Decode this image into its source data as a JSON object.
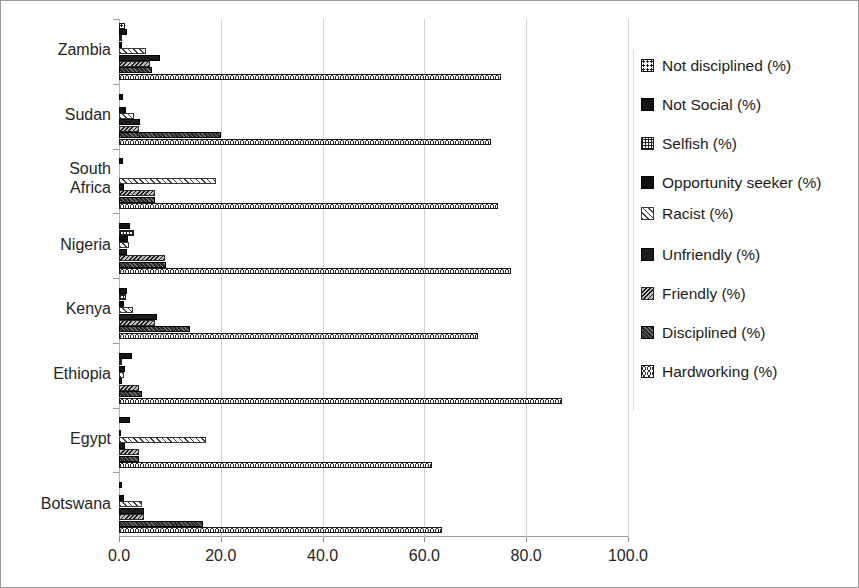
{
  "chart_data": {
    "type": "bar",
    "orientation": "horizontal",
    "title": "",
    "xlabel": "",
    "ylabel": "",
    "xlim": [
      0,
      100
    ],
    "xticks": [
      "0.0",
      "20.0",
      "40.0",
      "60.0",
      "80.0",
      "100.0"
    ],
    "xtick_values": [
      0,
      20,
      40,
      60,
      80,
      100
    ],
    "grid": true,
    "legend_position": "right",
    "categories": [
      "Zambia",
      "Sudan",
      "South Africa",
      "Nigeria",
      "Kenya",
      "Ethiopia",
      "Egypt",
      "Botswana"
    ],
    "series": [
      {
        "name": "Not disciplined  (%)",
        "pattern": "dotted-grid",
        "values": [
          1.2,
          0.0,
          0.0,
          0.0,
          0.0,
          0.0,
          0.0,
          0.0
        ]
      },
      {
        "name": "Not Social (%)",
        "pattern": "solid-black",
        "values": [
          1.5,
          0.8,
          0.7,
          2.2,
          1.6,
          2.6,
          2.2,
          0.6
        ]
      },
      {
        "name": "Selfish (%)",
        "pattern": "cross-hatch",
        "values": [
          0.6,
          0.0,
          0.0,
          2.9,
          1.3,
          0.5,
          0.0,
          0.0
        ]
      },
      {
        "name": "Opportunity seeker (%)",
        "pattern": "solid-black",
        "values": [
          0.5,
          1.3,
          0.0,
          1.8,
          1.0,
          1.1,
          0.4,
          1.0
        ]
      },
      {
        "name": "Racist (%)",
        "pattern": "diagonal-light",
        "values": [
          5.3,
          3.0,
          19.0,
          2.0,
          2.7,
          1.0,
          17.0,
          4.5
        ]
      },
      {
        "name": "Unfriendly (%)",
        "pattern": "dark-speckle",
        "values": [
          8.0,
          4.2,
          0.9,
          1.6,
          7.4,
          0.6,
          1.2,
          5.0
        ]
      },
      {
        "name": "Friendly (%)",
        "pattern": "diagonal-dark",
        "values": [
          6.0,
          4.0,
          7.0,
          9.0,
          7.0,
          4.0,
          4.0,
          5.0
        ]
      },
      {
        "name": "Disciplined (%)",
        "pattern": "hatch-grey",
        "values": [
          6.5,
          20.0,
          7.0,
          9.2,
          14.0,
          4.5,
          4.0,
          16.5
        ]
      },
      {
        "name": "Hardworking (%)",
        "pattern": "circles",
        "values": [
          75.0,
          73.0,
          74.5,
          77.0,
          70.5,
          87.0,
          61.5,
          63.5
        ]
      }
    ]
  },
  "legend": {
    "items": [
      {
        "label": "Not disciplined  (%)",
        "swatch": "dotted-grid-swatch"
      },
      {
        "label": "Not Social (%)",
        "swatch": "solid-black-swatch"
      },
      {
        "label": "Selfish (%)",
        "swatch": "cross-hatch-swatch"
      },
      {
        "label": "Opportunity seeker (%)",
        "swatch": "solid-black-swatch"
      },
      {
        "label": "Racist (%)",
        "swatch": "diagonal-light-swatch"
      },
      {
        "label": "Unfriendly (%)",
        "swatch": "dark-speckle-swatch"
      },
      {
        "label": "Friendly (%)",
        "swatch": "diagonal-dark-swatch"
      },
      {
        "label": "Disciplined (%)",
        "swatch": "hatch-grey-swatch"
      },
      {
        "label": "Hardworking (%)",
        "swatch": "circles-swatch"
      }
    ]
  }
}
